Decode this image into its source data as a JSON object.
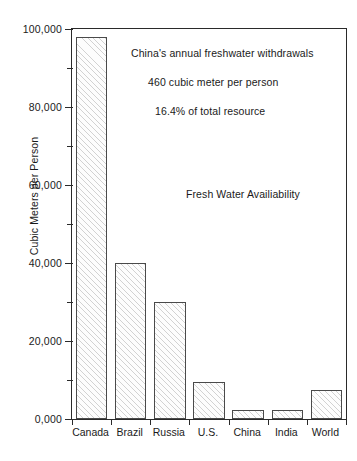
{
  "chart_data": {
    "type": "bar",
    "title": "",
    "xlabel": "",
    "ylabel": "Cubic Meters per Person",
    "categories": [
      "Canada",
      "Brazil",
      "Russia",
      "U.S.",
      "China",
      "India",
      "World"
    ],
    "values": [
      98000,
      40000,
      30000,
      9500,
      2300,
      2400,
      7500
    ],
    "ylim": [
      0,
      100000
    ],
    "ytick_labels": [
      "0,000",
      "20,000",
      "40,000",
      "60,000",
      "80,000",
      "100,000"
    ],
    "ytick_values": [
      0,
      20000,
      40000,
      60000,
      80000,
      100000
    ],
    "yminor_values": [
      10000,
      30000,
      50000,
      70000,
      90000
    ],
    "grid": false,
    "legend": null,
    "annotations": [
      "China's annual freshwater withdrawals",
      "460 cubic meter per person",
      "16.4% of total resource",
      "Fresh Water Availiability"
    ]
  }
}
